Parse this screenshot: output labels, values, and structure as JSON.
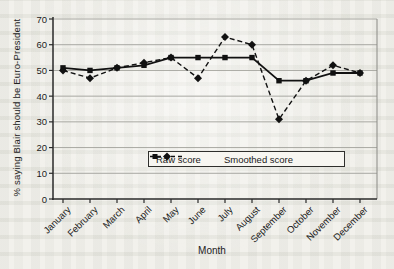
{
  "figure": {
    "background_color": "#f2f1ec",
    "axis_color": "#2a2a2a",
    "gridline_color": "#a8a8a2"
  },
  "chart_data": {
    "type": "line",
    "title": "",
    "xlabel": "Month",
    "ylabel": "% saying Blair should be Euro-President",
    "ylim": [
      0,
      70
    ],
    "yticks": [
      0,
      10,
      20,
      30,
      40,
      50,
      60,
      70
    ],
    "grid": true,
    "legend_position": "inside-bottom-center",
    "categories": [
      "January",
      "February",
      "March",
      "April",
      "May",
      "June",
      "July",
      "August",
      "September",
      "October",
      "November",
      "December"
    ],
    "series": [
      {
        "name": "Raw score",
        "marker": "diamond",
        "line_style": "dashed",
        "color": "#111111",
        "values": [
          50,
          47,
          51,
          53,
          55,
          47,
          63,
          60,
          31,
          46,
          52,
          49
        ]
      },
      {
        "name": "Smoothed score",
        "marker": "square",
        "line_style": "solid",
        "color": "#111111",
        "values": [
          51,
          50,
          51,
          52,
          55,
          55,
          55,
          55,
          46,
          46,
          49,
          49
        ]
      }
    ]
  }
}
